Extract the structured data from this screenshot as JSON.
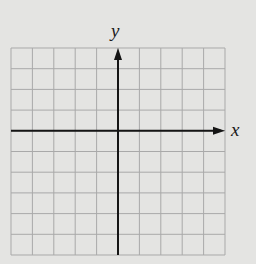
{
  "diagram": {
    "type": "cartesian-coordinate-grid",
    "grid": {
      "columns": 10,
      "rows": 10,
      "left": 11,
      "top": 48,
      "cell_width": 21.4,
      "cell_height": 20.7,
      "line_color": "#a9a9a9"
    },
    "axes": {
      "x_label": "x",
      "y_label": "y",
      "origin_column": 5,
      "origin_row": 4,
      "axis_color": "#151515",
      "x_arrow": "right",
      "y_arrow": "up"
    },
    "background_color": "#e4e4e2"
  }
}
